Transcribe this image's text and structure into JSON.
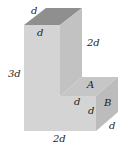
{
  "diagram": {
    "type": "3d-block-figure",
    "colors": {
      "top_face": "#8f8f8f",
      "front_face": "#d4d4d4",
      "side_face": "#c2c2c2",
      "face_a": "#c4c4c4",
      "face_b": "#bcbcbc",
      "background": "#ffffff"
    },
    "labels": {
      "top_back": "d",
      "top_front": "d",
      "right_height": "2d",
      "left_height": "3d",
      "face_a": "A",
      "face_b": "B",
      "step_width": "d",
      "step_height": "d",
      "depth": "d",
      "bottom_width": "2d"
    }
  }
}
